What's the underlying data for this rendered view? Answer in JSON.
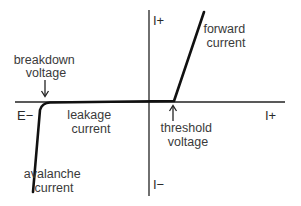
{
  "diagram": {
    "axes": {
      "x_positive_label": "I+",
      "x_negative_label": "E−",
      "y_positive_label": "I+",
      "y_negative_label": "I−"
    },
    "annotations": {
      "breakdown": [
        "breakdown",
        "voltage"
      ],
      "leakage": [
        "leakage",
        "current"
      ],
      "threshold": [
        "threshold",
        "voltage"
      ],
      "forward": [
        "forward",
        "current"
      ],
      "avalanche": [
        "avalanche",
        "current"
      ]
    },
    "arrows": {
      "breakdown_arrow": "down-arrow",
      "threshold_arrow": "up-arrow"
    },
    "colors": {
      "curve": "#111111",
      "axis": "#222222",
      "text": "#3a3a3a"
    }
  }
}
